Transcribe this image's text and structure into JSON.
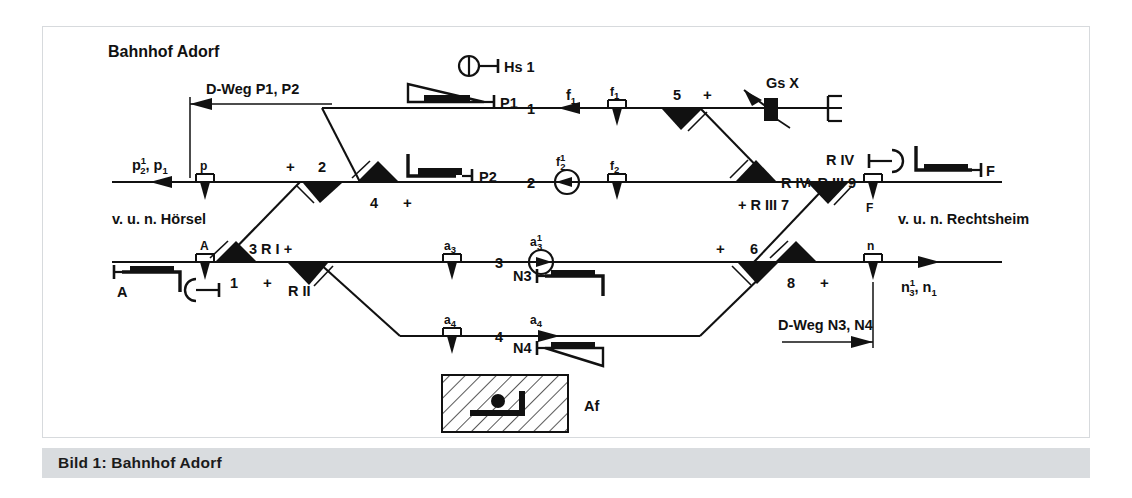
{
  "caption": {
    "label": "Bild 1:",
    "title": "Bahnhof Adorf",
    "full": "Bild 1:  Bahnhof Adorf"
  },
  "diagram": {
    "title": "Bahnhof Adorf",
    "left_line_label": "v. u. n. Hörsel",
    "right_line_label": "v. u. n. Rechtsheim",
    "danger_paths": {
      "left": "D-Weg P1, P2",
      "right": "D-Weg N3, N4"
    },
    "tracks": [
      {
        "number": "1"
      },
      {
        "number": "2"
      },
      {
        "number": "3"
      },
      {
        "number": "4"
      }
    ],
    "switches": [
      {
        "id": "1",
        "position": "+"
      },
      {
        "id": "2",
        "position": "+"
      },
      {
        "id": "4",
        "position": "+"
      },
      {
        "id": "5",
        "position": "+"
      },
      {
        "id": "6",
        "position": "+"
      },
      {
        "id": "8",
        "position": "+"
      },
      {
        "id": "3",
        "position": "+",
        "route_label": "3 R I +",
        "sub_label": "R II"
      },
      {
        "id": "7",
        "route_label": "R IV",
        "sub_label": "+ R III 7"
      },
      {
        "id": "9",
        "route_label": "R IV",
        "sub_label": "+ R III 9"
      }
    ],
    "signals": [
      {
        "name": "Hs 1",
        "type": "shunting-signal"
      },
      {
        "name": "P1",
        "type": "main-signal"
      },
      {
        "name": "P2",
        "type": "main-signal"
      },
      {
        "name": "A",
        "type": "main-signal"
      },
      {
        "name": "F",
        "type": "main-signal"
      },
      {
        "name": "N3",
        "type": "main-signal"
      },
      {
        "name": "N4",
        "type": "main-signal"
      },
      {
        "name": "Gs X",
        "type": "derailer"
      },
      {
        "name": "Af",
        "type": "locking-box"
      }
    ],
    "axle_counters": [
      {
        "name": "p"
      },
      {
        "name": "f1",
        "base": "f",
        "sub": "1"
      },
      {
        "name": "f2",
        "base": "f",
        "sub": "2"
      },
      {
        "name": "a3",
        "base": "a",
        "sub": "3"
      },
      {
        "name": "a4",
        "base": "a",
        "sub": "4"
      },
      {
        "name": "A"
      },
      {
        "name": "F"
      },
      {
        "name": "n"
      }
    ],
    "route_indicators": [
      {
        "base": "f",
        "sub": "1"
      },
      {
        "base": "f",
        "sub": "2",
        "sup": "1"
      },
      {
        "base": "a",
        "sub": "3"
      },
      {
        "base": "a",
        "sub": "3",
        "sup": "1"
      },
      {
        "base": "a",
        "sub": "4"
      },
      {
        "base": "p",
        "sub": "2",
        "sup": "1"
      },
      {
        "base": "p",
        "sub": "1"
      },
      {
        "base": "n",
        "sub": "3",
        "sup": "1"
      },
      {
        "base": "n",
        "sub": "1"
      }
    ],
    "af_box_label": "Af"
  }
}
